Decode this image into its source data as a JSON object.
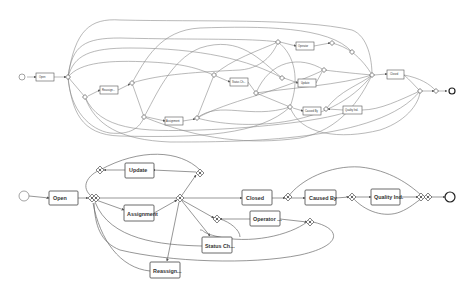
{
  "top_model": {
    "tasks": [
      {
        "id": "t_open",
        "label": "Open"
      },
      {
        "id": "t_reassign",
        "label": "Reassign..."
      },
      {
        "id": "t_assignment",
        "label": "Assignment"
      },
      {
        "id": "t_status",
        "label": "Status Ch..."
      },
      {
        "id": "t_operator",
        "label": "Operator"
      },
      {
        "id": "t_update",
        "label": "Update"
      },
      {
        "id": "t_causedby",
        "label": "Caused By"
      },
      {
        "id": "t_quality",
        "label": "Quality Ind."
      },
      {
        "id": "t_closed",
        "label": "Closed"
      }
    ]
  },
  "bottom_model": {
    "tasks": [
      {
        "id": "b_open",
        "label": "Open"
      },
      {
        "id": "b_update",
        "label": "Update"
      },
      {
        "id": "b_assignment",
        "label": "Assignment"
      },
      {
        "id": "b_status",
        "label": "Status Ch..."
      },
      {
        "id": "b_reassign",
        "label": "Reassign..."
      },
      {
        "id": "b_closed",
        "label": "Closed"
      },
      {
        "id": "b_operator",
        "label": "Operator ..."
      },
      {
        "id": "b_causedby",
        "label": "Caused By"
      },
      {
        "id": "b_quality",
        "label": "Quality Ind."
      }
    ]
  },
  "colors": {
    "edge": "#8a8a8a",
    "node_stroke": "#444444",
    "background": "#ffffff"
  }
}
